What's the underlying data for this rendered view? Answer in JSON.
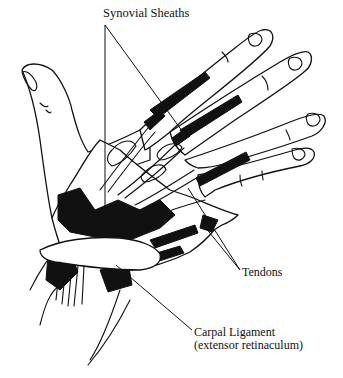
{
  "figure": {
    "labels": {
      "synovial_sheaths": "Synovial Sheaths",
      "tendons": "Tendons",
      "carpal_ligament": "Carpal Ligament",
      "carpal_ligament_alt": "(extensor retinaculum)"
    },
    "colors": {
      "background": "#ffffff",
      "ink": "#111111"
    }
  }
}
